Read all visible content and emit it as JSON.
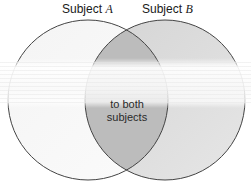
{
  "diagram": {
    "type": "venn",
    "circles": [
      {
        "id": "A",
        "label_prefix": "Subject",
        "label_var": "A",
        "fill": "#f2f2f2",
        "stroke": "#444444"
      },
      {
        "id": "B",
        "label_prefix": "Subject",
        "label_var": "B",
        "fill": "#d9d9d9",
        "stroke": "#444444"
      }
    ],
    "overlap": {
      "fill": "#bdbdbd",
      "text_line1": "to both",
      "text_line2": "subjects"
    }
  }
}
